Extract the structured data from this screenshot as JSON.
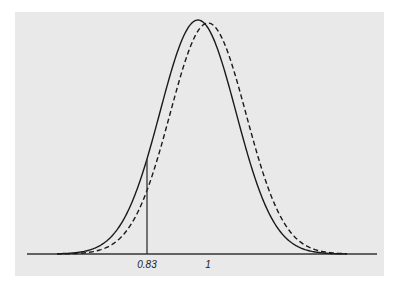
{
  "chart_data": {
    "type": "line",
    "title": "",
    "xlabel": "",
    "ylabel": "",
    "grid": false,
    "legend": null,
    "x_ticks": [
      {
        "label": "0.83",
        "value": 0.83
      },
      {
        "label": "1",
        "value": 1.0
      }
    ],
    "series": [
      {
        "name": "solid curve",
        "style": "solid",
        "distribution": "normal-like",
        "mean": 0.972,
        "sd": 0.106
      },
      {
        "name": "dashed curve",
        "style": "dashed",
        "distribution": "normal-like",
        "mean": 1.0,
        "sd": 0.106
      }
    ],
    "annotations": [
      {
        "type": "vertical-line",
        "x": 0.83,
        "from": "axis",
        "to": "solid curve"
      }
    ],
    "xlim": [
      0.47,
      1.48
    ]
  },
  "axis": {
    "px_per_unit": 359,
    "origin_value": 0.83,
    "origin_px": 147,
    "baseline_px": 254,
    "x_start_px": 27,
    "x_end_px": 377
  },
  "curves": {
    "solid": {
      "peak_px": 234,
      "sigma_px": 38
    },
    "dashed": {
      "peak_px": 231,
      "sigma_px": 38
    }
  },
  "colors": {
    "background": "#e9e9e9",
    "line": "#1a1a1a"
  }
}
